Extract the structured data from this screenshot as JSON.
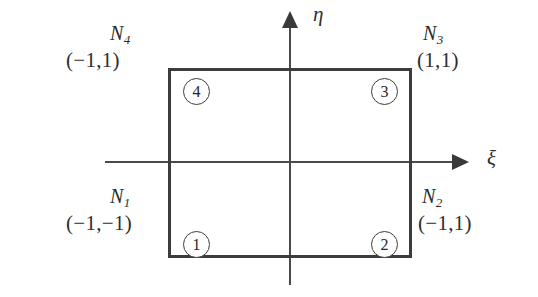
{
  "figure": {
    "stroke_color": "#3c3c3c",
    "background_color": "#ffffff"
  },
  "axes": {
    "horizontal": {
      "label": "ξ",
      "name": "xi"
    },
    "vertical": {
      "label": "η",
      "name": "eta"
    }
  },
  "nodes": [
    {
      "marker": "1",
      "shape_function": "N",
      "subscript": "1",
      "coordinates": "(−1,−1)",
      "position": "bottom-left"
    },
    {
      "marker": "2",
      "shape_function": "N",
      "subscript": "2",
      "coordinates": "(−1,1)",
      "position": "bottom-right"
    },
    {
      "marker": "3",
      "shape_function": "N",
      "subscript": "3",
      "coordinates": "(1,1)",
      "position": "top-right"
    },
    {
      "marker": "4",
      "shape_function": "N",
      "subscript": "4",
      "coordinates": "(−1,1)",
      "position": "top-left"
    }
  ],
  "chart_data": {
    "type": "scatter",
    "title": "",
    "xlabel": "ξ",
    "ylabel": "η",
    "xlim": [
      -1.6,
      1.6
    ],
    "ylim": [
      -1.35,
      1.35
    ],
    "grid": false,
    "legend": null,
    "shape": {
      "type": "rectangle",
      "corners": [
        [
          -1,
          -1
        ],
        [
          1,
          -1
        ],
        [
          1,
          1
        ],
        [
          -1,
          1
        ]
      ]
    },
    "points": [
      {
        "label": "1",
        "x": -1,
        "y": -1,
        "annotation": "N1 (−1,−1)"
      },
      {
        "label": "2",
        "x": 1,
        "y": -1,
        "annotation": "N2 (−1,1)"
      },
      {
        "label": "3",
        "x": 1,
        "y": 1,
        "annotation": "N3 (1,1)"
      },
      {
        "label": "4",
        "x": -1,
        "y": 1,
        "annotation": "N4 (−1,1)"
      }
    ],
    "annotations": [
      "η",
      "ξ",
      "N1",
      "N2",
      "N3",
      "N4",
      "(−1,−1)",
      "(−1,1)",
      "(1,1)",
      "(−1,1)"
    ]
  }
}
